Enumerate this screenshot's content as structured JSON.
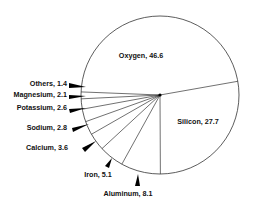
{
  "chart_data": {
    "type": "pie",
    "title": "",
    "categories": [
      "Oxygen",
      "Silicon",
      "Aluminum",
      "Iron",
      "Calcium",
      "Sodium",
      "Potassium",
      "Magnesium",
      "Others"
    ],
    "values": [
      46.6,
      27.7,
      8.1,
      5.1,
      3.6,
      2.8,
      2.6,
      2.1,
      1.4
    ],
    "labels": [
      "Oxygen, 46.6",
      "Silicon, 27.7",
      "Aluminum, 8.1",
      "Iron, 5.1",
      "Calcium, 3.6",
      "Sodium, 2.8",
      "Potassium, 2.6",
      "Magnesium, 2.1",
      "Others, 1.4"
    ],
    "label_placement": [
      "inside",
      "inside",
      "outside",
      "outside",
      "outside",
      "outside",
      "outside",
      "outside",
      "outside"
    ],
    "start_angle_deg": -10,
    "direction": "clockwise",
    "colors": {
      "fill": "#ffffff",
      "stroke": "#333333",
      "text": "#111111",
      "marker": "#000000"
    }
  }
}
